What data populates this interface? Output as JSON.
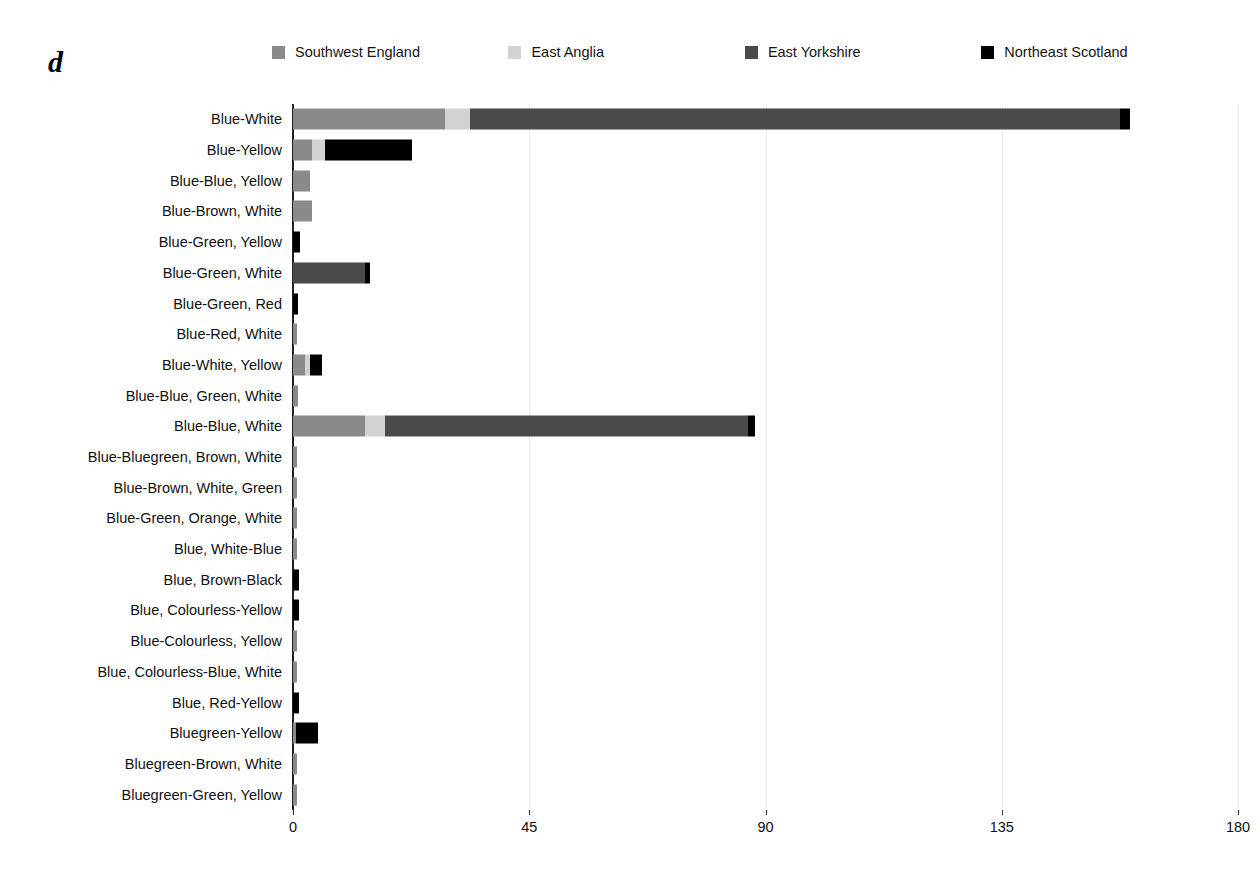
{
  "panel": {
    "letter": "d"
  },
  "legend": {
    "items": [
      {
        "label": "Southwest England",
        "color": "#8a8a8a",
        "icon": "legend-swatch-icon"
      },
      {
        "label": "East Anglia",
        "color": "#d2d2d2",
        "icon": "legend-swatch-icon"
      },
      {
        "label": "East Yorkshire",
        "color": "#4a4a4a",
        "icon": "legend-swatch-icon"
      },
      {
        "label": "Northeast Scotland",
        "color": "#000000",
        "icon": "legend-swatch-icon"
      }
    ]
  },
  "chart_data": {
    "type": "bar",
    "orientation": "horizontal",
    "stacked": true,
    "title": "",
    "xlabel": "",
    "ylabel": "",
    "xlim": [
      0,
      180
    ],
    "xticks": [
      0,
      45,
      90,
      135,
      180
    ],
    "grid": true,
    "legend_position": "top",
    "series": [
      {
        "name": "Southwest England",
        "color": "#8a8a8a",
        "values": [
          29,
          3.6,
          3.2,
          3.6,
          0,
          0,
          0,
          0.8,
          2.3,
          1,
          13.7,
          0.8,
          0.8,
          0.8,
          0.8,
          0,
          0,
          0.8,
          0.8,
          0,
          0.6,
          0.8,
          0.8
        ]
      },
      {
        "name": "East Anglia",
        "color": "#d2d2d2",
        "values": [
          4.8,
          2.5,
          0,
          0,
          0,
          0,
          0,
          0,
          1,
          0,
          3.8,
          0,
          0,
          0,
          0,
          0,
          0,
          0,
          0,
          0,
          0,
          0,
          0
        ]
      },
      {
        "name": "East Yorkshire",
        "color": "#4a4a4a",
        "values": [
          123.8,
          0,
          0,
          0,
          0,
          13.7,
          0,
          0,
          0,
          0,
          69.2,
          0,
          0,
          0,
          0,
          0,
          0,
          0,
          0,
          0,
          0,
          0,
          0
        ]
      },
      {
        "name": "Northeast Scotland",
        "color": "#000000",
        "values": [
          1.9,
          16.6,
          0,
          0,
          1.3,
          1,
          1,
          0,
          2.3,
          0,
          1.3,
          0,
          0,
          0,
          0,
          1.1,
          1.1,
          0,
          0,
          1.1,
          4.2,
          0,
          0
        ]
      }
    ],
    "categories": [
      "Blue-White",
      "Blue-Yellow",
      "Blue-Blue, Yellow",
      "Blue-Brown, White",
      "Blue-Green, Yellow",
      "Blue-Green, White",
      "Blue-Green, Red",
      "Blue-Red, White",
      "Blue-White, Yellow",
      "Blue-Blue, Green, White",
      "Blue-Blue, White",
      "Blue-Bluegreen, Brown, White",
      "Blue-Brown, White, Green",
      "Blue-Green, Orange, White",
      "Blue, White-Blue",
      "Blue, Brown-Black",
      "Blue, Colourless-Yellow",
      "Blue-Colourless, Yellow",
      "Blue, Colourless-Blue, White",
      "Blue, Red-Yellow",
      "Bluegreen-Yellow",
      "Bluegreen-Brown, White",
      "Bluegreen-Green, Yellow"
    ],
    "totals": [
      159.5,
      22.7,
      3.2,
      3.6,
      1.3,
      14.7,
      1.0,
      0.8,
      5.6,
      1.0,
      88.0,
      0.8,
      0.8,
      0.8,
      0.8,
      1.1,
      1.1,
      0.8,
      0.8,
      1.1,
      4.8,
      0.8,
      0.8
    ]
  }
}
